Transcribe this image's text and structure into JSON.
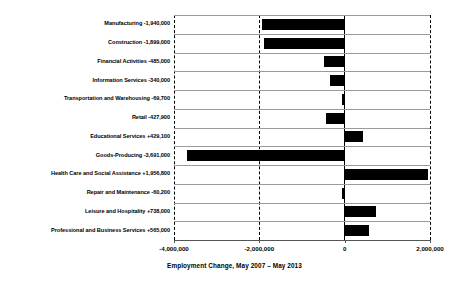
{
  "chart_data": {
    "type": "bar",
    "orientation": "horizontal",
    "title": "",
    "xlabel": "Employment Change, May 2007 – May 2013",
    "ylabel": "",
    "xlim": [
      -4000000,
      2000000
    ],
    "xticks": [
      -4000000,
      -2000000,
      0,
      2000000
    ],
    "xtick_labels": [
      "-4,000,000",
      "-2,000,000",
      "0",
      "2,000,000"
    ],
    "grid": true,
    "gridlines_vertical": [
      -4000000,
      -2000000,
      2000000
    ],
    "zero_line": 0,
    "legend": null,
    "bar_color": "#000000",
    "background_color": "#ffffff",
    "categories": [
      "Manufacturing",
      "Construction",
      "Financial Activities",
      "Information Services",
      "Transportation and Warehousing",
      "Retail",
      "Educational Services",
      "Goods-Producing",
      "Health Care and Social Assistance",
      "Repair and Maintenance",
      "Leisure and Hospitality",
      "Professional and Business Services"
    ],
    "values": [
      -1940000,
      -1899000,
      -485000,
      -340000,
      -69700,
      -427900,
      429100,
      -3691000,
      1956800,
      -60200,
      738000,
      565000
    ],
    "value_labels": [
      "-1,940,000",
      "-1,899,000",
      "-485,000",
      "-340,000",
      "-69,700",
      "-427,900",
      "+429,100",
      "-3,691,000",
      "+1,956,800",
      "-60,200",
      "+738,000",
      "+565,000"
    ],
    "row_labels": [
      "Manufacturing -1,940,000",
      "Construction -1,899,000",
      "Financial Activities -485,000",
      "Information Services -340,000",
      "Transportation and Warehousing -69,700",
      "Retail -427,900",
      "Educational Services +429,100",
      "Goods-Producing -3,691,000",
      "Health Care and Social Assistance +1,956,800",
      "Repair and Maintenance -60,200",
      "Leisure and Hospitality +738,000",
      "Professional and Business Services +565,000"
    ]
  }
}
